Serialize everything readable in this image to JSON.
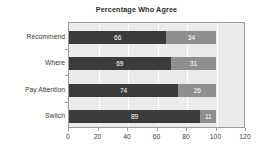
{
  "chart_data": {
    "type": "bar",
    "orientation": "horizontal",
    "stacked": true,
    "title": "Percentage Who Agree",
    "xlabel": "",
    "ylabel": "",
    "xlim": [
      0,
      120
    ],
    "xticks": [
      0,
      20,
      40,
      60,
      80,
      100,
      120
    ],
    "xtick_labels": [
      "0",
      "20",
      "40",
      "60",
      "80",
      "100",
      "120"
    ],
    "grid": true,
    "grid_axis": "x",
    "legend": false,
    "categories": [
      "Recommend",
      "Where",
      "Pay Attention",
      "Switch"
    ],
    "series": [
      {
        "name": "Agree",
        "values": [
          66,
          69,
          74,
          89
        ],
        "color": "#3b3b3b"
      },
      {
        "name": "Disagree",
        "values": [
          34,
          31,
          26,
          11
        ],
        "color": "#8f8f8f"
      }
    ],
    "bars": [
      {
        "category": "Recommend",
        "segments": [
          {
            "value": 66,
            "label": "66",
            "color": "#3b3b3b"
          },
          {
            "value": 34,
            "label": "34",
            "color": "#8f8f8f"
          }
        ]
      },
      {
        "category": "Where",
        "segments": [
          {
            "value": 69,
            "label": "69",
            "color": "#3b3b3b"
          },
          {
            "value": 31,
            "label": "31",
            "color": "#8f8f8f"
          }
        ]
      },
      {
        "category": "Pay Attention",
        "segments": [
          {
            "value": 74,
            "label": "74",
            "color": "#3b3b3b"
          },
          {
            "value": 26,
            "label": "26",
            "color": "#8f8f8f"
          }
        ]
      },
      {
        "category": "Switch",
        "segments": [
          {
            "value": 89,
            "label": "89",
            "color": "#3b3b3b"
          },
          {
            "value": 11,
            "label": "11",
            "color": "#8f8f8f"
          }
        ]
      }
    ]
  },
  "style": {
    "plot_background": "#ebebeb",
    "page_background": "#ffffff",
    "axis_color": "#9a9a9a",
    "gridline_color": "#ffffff",
    "text_color": "#3a3a3a",
    "title_color": "#2b2b2b",
    "value_label_color": "#ffffff"
  }
}
